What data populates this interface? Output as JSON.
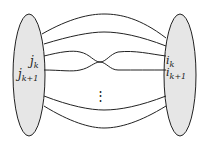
{
  "diagram": {
    "left_set": {
      "labels": [
        "j",
        "j"
      ],
      "subscripts": [
        "k",
        "k+1"
      ],
      "fill": "#e6e6e6"
    },
    "right_set": {
      "labels": [
        "i",
        "i"
      ],
      "subscripts": [
        "k",
        "k+1"
      ],
      "fill": "#e6e6e6"
    },
    "ellipsis": "⋮",
    "strand_count_visible": 6,
    "crossing": "strands k and k+1 cross in the middle",
    "line_color": "#222222"
  }
}
